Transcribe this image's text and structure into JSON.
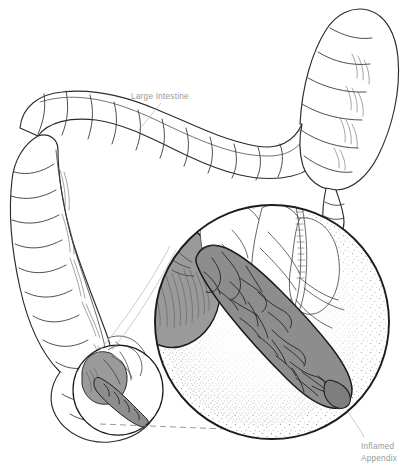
{
  "figure": {
    "background_color": "#ffffff",
    "width": 415,
    "height": 476,
    "style": "line-art anatomical illustration with stippling and grayscale fills"
  },
  "labels": {
    "large_intestine": "Large Intestine",
    "inflamed_appendix_line1": "Inflamed",
    "inflamed_appendix_line2": "Appendix"
  },
  "colors": {
    "outline": "#2b2b2b",
    "label_text": "#9a9a9a",
    "appendix_gray": "#8d8d8d",
    "cecum_gray": "#9a9a9a",
    "stipple": "#6e6e6e",
    "leader_line": "#b6b6b6",
    "dashed_connector": "#8d8d8d",
    "circle_frame": "#1c1c1c",
    "background": "#ffffff"
  },
  "anatomy": {
    "structures": [
      "ascending colon",
      "transverse colon",
      "descending colon",
      "hepatic flexure",
      "splenic flexure",
      "cecum",
      "vermiform appendix",
      "ileum",
      "mesenteric vessels"
    ],
    "haustra_segments": 46
  },
  "callout": {
    "source_circle": {
      "cx": 118,
      "cy": 390,
      "r": 46
    },
    "magnified_circle": {
      "cx": 272,
      "cy": 322,
      "r": 118
    },
    "connector_type": "dashed-and-tangent-leader-lines"
  },
  "label_leaders": {
    "large_intestine": {
      "x1": 161,
      "y1": 99,
      "x2": 138,
      "y2": 131
    },
    "inflamed_appendix": {
      "x1": 363,
      "y1": 436,
      "x2": 348,
      "y2": 414
    }
  }
}
